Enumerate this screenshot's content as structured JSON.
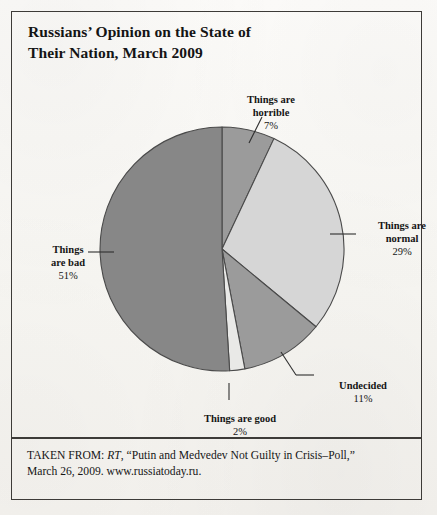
{
  "figure": {
    "title": "Russians’ Opinion on the State of\nTheir Nation, March 2009",
    "title_line1": "Russians’ Opinion on the State of",
    "title_line2": "Their Nation, March 2009"
  },
  "source": {
    "prefix": "TAKEN FROM: ",
    "publication": "RT",
    "rest_line1": ", “Putin and Medvedev Not Guilty in Crisis–Poll,”",
    "line2": "March 26, 2009. www.russiatoday.ru."
  },
  "labels": {
    "horrible": {
      "name_line1": "Things are",
      "name_line2": "horrible",
      "pct": "7%"
    },
    "normal": {
      "name_line1": "Things are",
      "name_line2": "normal",
      "pct": "29%"
    },
    "undecided": {
      "name_line1": "Undecided",
      "name_line2": "",
      "pct": "11%"
    },
    "good": {
      "name_line1": "Things are good",
      "name_line2": "",
      "pct": "2%"
    },
    "bad": {
      "name_line1": "Things",
      "name_line2": "are bad",
      "pct": "51%"
    }
  },
  "chart_data": {
    "type": "pie",
    "title": "Russians’ Opinion on the State of Their Nation, March 2009",
    "categories": [
      "Things are horrible",
      "Things are normal",
      "Undecided",
      "Things are good",
      "Things are bad"
    ],
    "values": [
      7,
      29,
      11,
      2,
      51
    ],
    "value_labels": [
      "7%",
      "29%",
      "11%",
      "2%",
      "51%"
    ],
    "unit": "percent",
    "total": 100,
    "start_angle_deg": 0,
    "direction": "clockwise",
    "colors": [
      "#9b9b9b",
      "#d6d6d6",
      "#9b9b9b",
      "#e9e9e7",
      "#878787"
    ],
    "stroke_color": "#4a4a4a",
    "legend": "none",
    "labels_position": "outside-with-leader-lines",
    "geometry": {
      "center_x": 222,
      "center_y": 249,
      "radius": 122
    }
  },
  "colors": {
    "paper": "#fbfaf7",
    "frame": "#3d3b38",
    "ink": "#151515",
    "slice_medium": "#9b9b9b",
    "slice_light": "#d6d6d6",
    "slice_pale": "#e9e9e7",
    "slice_dark": "#878787",
    "slice_outline": "#4a4a4a"
  }
}
